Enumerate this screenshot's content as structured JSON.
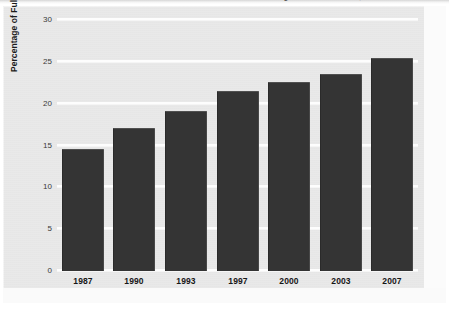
{
  "figure": {
    "cropped_caption_top": "Gender in Law Enforcement: Percentage of Female Officers, 1987-2007",
    "background_color": "#e9e9e9",
    "bar_color": "#343434",
    "gridline_color": "#fdfdfd"
  },
  "chart_data": {
    "type": "bar",
    "title": "",
    "xlabel": "",
    "ylabel": "Percentage of Full-Time Sworn Personnel",
    "categories": [
      "1987",
      "1990",
      "1993",
      "1997",
      "2000",
      "2003",
      "2007"
    ],
    "values": [
      14.6,
      17.1,
      19.1,
      21.5,
      22.6,
      23.6,
      25.5
    ],
    "ylim": [
      0,
      30
    ],
    "ytick_labels": [
      "0",
      "5",
      "10",
      "15",
      "20",
      "25",
      "30"
    ],
    "ytick_values": [
      0,
      5,
      10,
      15,
      20,
      25,
      30
    ],
    "grid": true,
    "grid_axis": "y",
    "legend": false,
    "legend_position": "none",
    "series": [
      {
        "name": "Percentage of Full-Time Sworn Personnel",
        "values": [
          14.6,
          17.1,
          19.1,
          21.5,
          22.6,
          23.6,
          25.5
        ]
      }
    ]
  }
}
